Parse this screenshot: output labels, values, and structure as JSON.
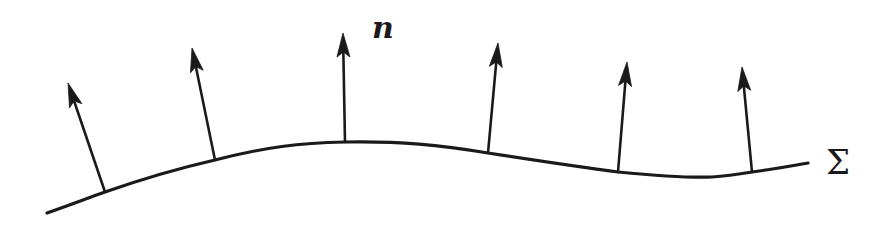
{
  "diagram": {
    "normal_label": "n",
    "surface_label": "Σ",
    "normal_count": 6,
    "colors": {
      "ink": "#1a1a1a",
      "background": "#ffffff"
    }
  }
}
